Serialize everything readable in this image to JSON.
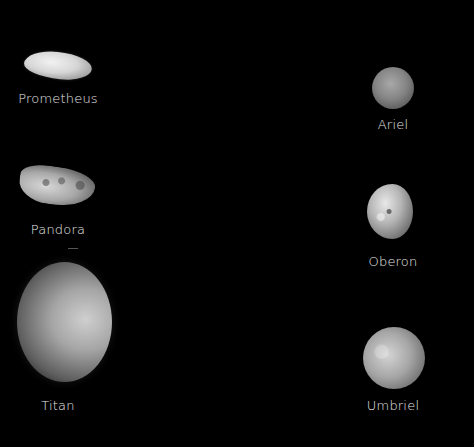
{
  "figure": {
    "background": "#000000",
    "moons": [
      {
        "name": "Prometheus",
        "column": "left",
        "shape": "elongated irregular"
      },
      {
        "name": "Pandora",
        "column": "left",
        "shape": "irregular cratered"
      },
      {
        "name": "Titan",
        "column": "left",
        "shape": "hazy sphere"
      },
      {
        "name": "Ariel",
        "column": "right",
        "shape": "sphere"
      },
      {
        "name": "Oberon",
        "column": "right",
        "shape": "gibbous sphere"
      },
      {
        "name": "Umbriel",
        "column": "right",
        "shape": "cratered sphere"
      }
    ]
  }
}
